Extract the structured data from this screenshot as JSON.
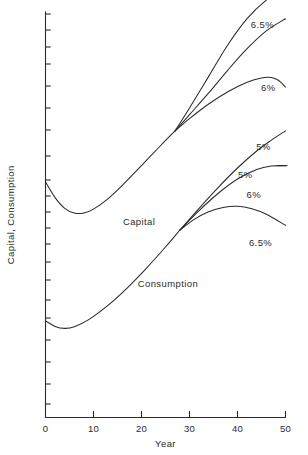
{
  "chart_data": {
    "type": "line",
    "title": "",
    "subtitle": "",
    "xlabel": "Year",
    "ylabel": "Capital, Consumption",
    "xlim": [
      0,
      50
    ],
    "ylim": [
      0,
      1
    ],
    "grid": false,
    "legend_position": "inline-curve-labels",
    "x_ticks": [
      {
        "value": 0,
        "label": "0"
      },
      {
        "value": 10,
        "label": "10"
      },
      {
        "value": 20,
        "label": "20"
      },
      {
        "value": 30,
        "label": "30"
      },
      {
        "value": 40,
        "label": "40"
      },
      {
        "value": 50,
        "label": "50"
      }
    ],
    "y_ticks_labels": [],
    "y_ticks_count": 18,
    "annotations": [
      {
        "text": "Capital",
        "x": 19.5,
        "y": 0.455
      },
      {
        "text": "Consumption",
        "x": 25.5,
        "y": 0.3
      },
      {
        "text": "6.5%",
        "x": 45.2,
        "y": 0.955
      },
      {
        "text": "6%",
        "x": 46.4,
        "y": 0.795
      },
      {
        "text": "5%",
        "x": 45.4,
        "y": 0.645
      },
      {
        "text": "5%",
        "x": 41.6,
        "y": 0.575
      },
      {
        "text": "6%",
        "x": 43.4,
        "y": 0.525
      },
      {
        "text": "6.5%",
        "x": 44.8,
        "y": 0.402
      }
    ],
    "series": [
      {
        "name": "Capital",
        "rate": "common-trunk",
        "group": "capital",
        "points": [
          [
            0,
            0.565
          ],
          [
            2,
            0.525
          ],
          [
            4,
            0.498
          ],
          [
            6,
            0.486
          ],
          [
            8,
            0.486
          ],
          [
            10,
            0.496
          ],
          [
            13,
            0.522
          ],
          [
            16,
            0.556
          ],
          [
            20,
            0.606
          ],
          [
            24,
            0.657
          ],
          [
            27,
            0.694
          ]
        ]
      },
      {
        "name": "Capital 5%",
        "rate": "5%",
        "group": "capital",
        "points": [
          [
            27,
            0.694
          ],
          [
            30,
            0.725
          ],
          [
            34,
            0.762
          ],
          [
            38,
            0.793
          ],
          [
            42,
            0.817
          ],
          [
            45,
            0.828
          ],
          [
            47,
            0.829
          ],
          [
            48.5,
            0.822
          ],
          [
            50,
            0.805
          ]
        ]
      },
      {
        "name": "Capital 6%",
        "rate": "6%",
        "group": "capital",
        "points": [
          [
            27,
            0.694
          ],
          [
            30,
            0.735
          ],
          [
            34,
            0.79
          ],
          [
            38,
            0.848
          ],
          [
            42,
            0.902
          ],
          [
            46,
            0.947
          ],
          [
            50,
            0.978
          ]
        ]
      },
      {
        "name": "Capital 6.5%",
        "rate": "6.5%",
        "group": "capital",
        "points": [
          [
            27,
            0.694
          ],
          [
            30,
            0.752
          ],
          [
            34,
            0.832
          ],
          [
            38,
            0.912
          ],
          [
            42,
            0.978
          ],
          [
            46,
            1.025
          ],
          [
            50,
            1.055
          ]
        ]
      },
      {
        "name": "Consumption",
        "rate": "common-trunk",
        "group": "consumption",
        "points": [
          [
            0,
            0.213
          ],
          [
            2,
            0.199
          ],
          [
            4,
            0.194
          ],
          [
            6,
            0.198
          ],
          [
            9,
            0.216
          ],
          [
            13,
            0.252
          ],
          [
            17,
            0.296
          ],
          [
            21,
            0.346
          ],
          [
            25,
            0.4
          ],
          [
            28,
            0.443
          ]
        ]
      },
      {
        "name": "Consumption 5%",
        "rate": "5%",
        "group": "consumption",
        "points": [
          [
            28,
            0.443
          ],
          [
            32,
            0.498
          ],
          [
            36,
            0.551
          ],
          [
            40,
            0.6
          ],
          [
            44,
            0.643
          ],
          [
            47,
            0.67
          ],
          [
            50,
            0.694
          ]
        ]
      },
      {
        "name": "Consumption 6%",
        "rate": "6%",
        "group": "consumption",
        "points": [
          [
            28,
            0.443
          ],
          [
            32,
            0.492
          ],
          [
            36,
            0.536
          ],
          [
            40,
            0.572
          ],
          [
            44,
            0.596
          ],
          [
            47,
            0.605
          ],
          [
            50,
            0.606
          ]
        ]
      },
      {
        "name": "Consumption 6.5%",
        "rate": "6.5%",
        "group": "consumption",
        "points": [
          [
            28,
            0.443
          ],
          [
            31,
            0.47
          ],
          [
            34,
            0.489
          ],
          [
            37,
            0.5
          ],
          [
            40,
            0.503
          ],
          [
            43,
            0.497
          ],
          [
            46,
            0.483
          ],
          [
            50,
            0.455
          ]
        ]
      }
    ]
  },
  "colors": {
    "ink": "#2b2b2b",
    "background": "#ffffff"
  }
}
